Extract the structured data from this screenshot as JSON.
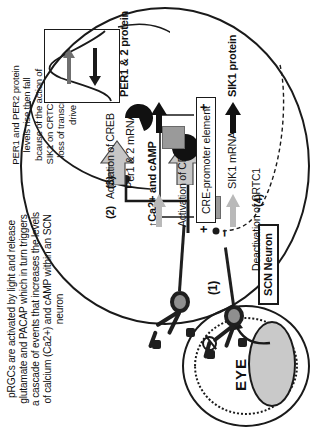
{
  "figure": {
    "orientation": "rotated-90-ccw",
    "background_color": "#ffffff",
    "ink_color": "#1a1a1a"
  },
  "captions": {
    "prgc_caption": "pRGCs are activated by light and release glutamate and PACAP which in turn triggers a cascade of events that increases the levels of calcium (Ca2+) and cAMP within an SCN neuron",
    "per_caption": "PER1 and PER2 protein levels rise then fall bcause of the action of SIK1 on CRTC1 and the loss of transcriptional drive"
  },
  "eye": {
    "label": "EYE",
    "photon_icon": "light-photon-icon"
  },
  "prgc": {
    "step_marker": "(1)",
    "neuron_count": 2
  },
  "scn": {
    "container_label": "SCN Neuron",
    "signal_label": "↑Ca2+ and cAMP",
    "steps": {
      "step2": "(2)",
      "step3": "(3)",
      "step4": "(4)"
    },
    "activation_crtc1": "Activation of CRTC1",
    "activation_creb": "Activation of CREB",
    "deactivation_crtc1": "Deactivation of CRTC1",
    "cre_promoter": "CRE-promoter element",
    "plus_left": "+",
    "plus_right": "+",
    "minus": "–",
    "transcripts": {
      "sik1_mrna": "SIK1 mRNA",
      "per_mrna": "Per1 & 2 mRNA"
    },
    "proteins": {
      "sik1_protein": "SIK1 protein",
      "per_protein": "PER1 & 2 protein"
    }
  },
  "inset_graph": {
    "description": "PER protein level curve rising then falling",
    "arrow_right": "rise-arrow-icon",
    "arrow_left": "fall-arrow-icon"
  },
  "colors": {
    "molecule_grey": "#9a9a9a",
    "molecule_black": "#111111",
    "arrow_grey": "#b9b9b9",
    "soma_grey": "#8f8f8f",
    "lens_grey": "#c9c9c9"
  }
}
